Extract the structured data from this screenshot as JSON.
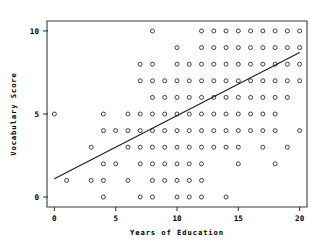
{
  "chart_data": {
    "type": "scatter",
    "title": "",
    "xlabel": "Years of Education",
    "ylabel": "Vocabulary Score",
    "xlim": [
      -0.6,
      20.6
    ],
    "ylim": [
      -0.6,
      10.6
    ],
    "xticks": [
      0,
      5,
      10,
      15,
      20
    ],
    "xticklabels": [
      "0",
      "5",
      "10",
      "15",
      "20"
    ],
    "yticks": [
      0,
      5,
      10
    ],
    "yticklabels": [
      "0",
      "5",
      "10"
    ],
    "grid": false,
    "legend": null,
    "marker": "open-circle",
    "marker_color": "#222222",
    "points": [
      [
        8,
        10
      ],
      [
        12,
        10
      ],
      [
        13,
        10
      ],
      [
        14,
        10
      ],
      [
        15,
        10
      ],
      [
        16,
        10
      ],
      [
        17,
        10
      ],
      [
        18,
        10
      ],
      [
        19,
        10
      ],
      [
        20,
        10
      ],
      [
        10,
        9
      ],
      [
        12,
        9
      ],
      [
        13,
        9
      ],
      [
        14,
        9
      ],
      [
        15,
        9
      ],
      [
        16,
        9
      ],
      [
        17,
        9
      ],
      [
        18,
        9
      ],
      [
        19,
        9
      ],
      [
        20,
        9
      ],
      [
        7,
        8
      ],
      [
        8,
        8
      ],
      [
        10,
        8
      ],
      [
        11,
        8
      ],
      [
        12,
        8
      ],
      [
        13,
        8
      ],
      [
        14,
        8
      ],
      [
        15,
        8
      ],
      [
        16,
        8
      ],
      [
        17,
        8
      ],
      [
        18,
        8
      ],
      [
        19,
        8
      ],
      [
        20,
        8
      ],
      [
        7,
        7
      ],
      [
        8,
        7
      ],
      [
        9,
        7
      ],
      [
        10,
        7
      ],
      [
        11,
        7
      ],
      [
        12,
        7
      ],
      [
        13,
        7
      ],
      [
        14,
        7
      ],
      [
        15,
        7
      ],
      [
        16,
        7
      ],
      [
        17,
        7
      ],
      [
        18,
        7
      ],
      [
        19,
        7
      ],
      [
        20,
        7
      ],
      [
        8,
        6
      ],
      [
        9,
        6
      ],
      [
        10,
        6
      ],
      [
        11,
        6
      ],
      [
        12,
        6
      ],
      [
        13,
        6
      ],
      [
        14,
        6
      ],
      [
        15,
        6
      ],
      [
        16,
        6
      ],
      [
        17,
        6
      ],
      [
        18,
        6
      ],
      [
        19,
        6
      ],
      [
        0,
        5
      ],
      [
        4,
        5
      ],
      [
        6,
        5
      ],
      [
        7,
        5
      ],
      [
        8,
        5
      ],
      [
        9,
        5
      ],
      [
        10,
        5
      ],
      [
        11,
        5
      ],
      [
        12,
        5
      ],
      [
        13,
        5
      ],
      [
        14,
        5
      ],
      [
        15,
        5
      ],
      [
        16,
        5
      ],
      [
        17,
        5
      ],
      [
        18,
        5
      ],
      [
        4,
        4
      ],
      [
        5,
        4
      ],
      [
        6,
        4
      ],
      [
        7,
        4
      ],
      [
        8,
        4
      ],
      [
        9,
        4
      ],
      [
        10,
        4
      ],
      [
        11,
        4
      ],
      [
        12,
        4
      ],
      [
        13,
        4
      ],
      [
        14,
        4
      ],
      [
        15,
        4
      ],
      [
        16,
        4
      ],
      [
        17,
        4
      ],
      [
        18,
        4
      ],
      [
        20,
        4
      ],
      [
        3,
        3
      ],
      [
        6,
        3
      ],
      [
        7,
        3
      ],
      [
        8,
        3
      ],
      [
        9,
        3
      ],
      [
        10,
        3
      ],
      [
        11,
        3
      ],
      [
        12,
        3
      ],
      [
        13,
        3
      ],
      [
        14,
        3
      ],
      [
        15,
        3
      ],
      [
        17,
        3
      ],
      [
        19,
        3
      ],
      [
        4,
        2
      ],
      [
        5,
        2
      ],
      [
        7,
        2
      ],
      [
        8,
        2
      ],
      [
        9,
        2
      ],
      [
        10,
        2
      ],
      [
        11,
        2
      ],
      [
        12,
        2
      ],
      [
        15,
        2
      ],
      [
        18,
        2
      ],
      [
        1,
        1
      ],
      [
        3,
        1
      ],
      [
        4,
        1
      ],
      [
        6,
        1
      ],
      [
        8,
        1
      ],
      [
        9,
        1
      ],
      [
        10,
        1
      ],
      [
        11,
        1
      ],
      [
        12,
        1
      ],
      [
        4,
        0
      ],
      [
        7,
        0
      ],
      [
        8,
        0
      ],
      [
        10,
        0
      ],
      [
        11,
        0
      ],
      [
        12,
        0
      ],
      [
        14,
        0
      ]
    ],
    "fit_line": {
      "name": "regression-line",
      "x0": 0,
      "y0": 1.1,
      "x1": 20,
      "y1": 8.7
    }
  }
}
